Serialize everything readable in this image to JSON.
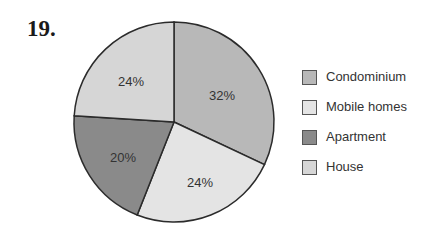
{
  "question_number": "19.",
  "chart_data": {
    "type": "pie",
    "title": "",
    "categories": [
      "Condominium",
      "Mobile homes",
      "Apartment",
      "House"
    ],
    "values": [
      32,
      24,
      20,
      24
    ],
    "labels": [
      "32%",
      "24%",
      "20%",
      "24%"
    ],
    "colors": [
      "#b8b8b8",
      "#e4e4e4",
      "#8a8a8a",
      "#d6d6d6"
    ],
    "start_angle": "12 o'clock",
    "direction": "clockwise",
    "legend_position": "right",
    "legend": [
      {
        "label": "Condominium",
        "color": "#b8b8b8"
      },
      {
        "label": "Mobile homes",
        "color": "#e4e4e4"
      },
      {
        "label": "Apartment",
        "color": "#8a8a8a"
      },
      {
        "label": "House",
        "color": "#d6d6d6"
      }
    ]
  }
}
